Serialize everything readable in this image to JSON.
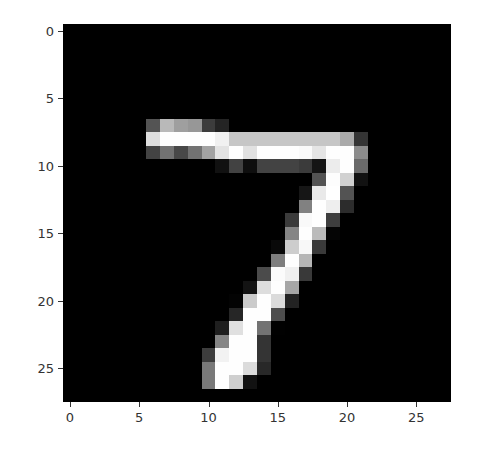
{
  "chart_data": {
    "type": "heatmap",
    "title": "",
    "xlabel": "",
    "ylabel": "",
    "colormap": "gray",
    "xlim": [
      -0.5,
      27.5
    ],
    "ylim": [
      27.5,
      -0.5
    ],
    "x_ticks": [
      0,
      5,
      10,
      15,
      20,
      25
    ],
    "y_ticks": [
      0,
      5,
      10,
      15,
      20,
      25
    ],
    "grid": false,
    "shape": [
      28,
      28
    ],
    "values": [
      [
        0,
        0,
        0,
        0,
        0,
        0,
        0,
        0,
        0,
        0,
        0,
        0,
        0,
        0,
        0,
        0,
        0,
        0,
        0,
        0,
        0,
        0,
        0,
        0,
        0,
        0,
        0,
        0
      ],
      [
        0,
        0,
        0,
        0,
        0,
        0,
        0,
        0,
        0,
        0,
        0,
        0,
        0,
        0,
        0,
        0,
        0,
        0,
        0,
        0,
        0,
        0,
        0,
        0,
        0,
        0,
        0,
        0
      ],
      [
        0,
        0,
        0,
        0,
        0,
        0,
        0,
        0,
        0,
        0,
        0,
        0,
        0,
        0,
        0,
        0,
        0,
        0,
        0,
        0,
        0,
        0,
        0,
        0,
        0,
        0,
        0,
        0
      ],
      [
        0,
        0,
        0,
        0,
        0,
        0,
        0,
        0,
        0,
        0,
        0,
        0,
        0,
        0,
        0,
        0,
        0,
        0,
        0,
        0,
        0,
        0,
        0,
        0,
        0,
        0,
        0,
        0
      ],
      [
        0,
        0,
        0,
        0,
        0,
        0,
        0,
        0,
        0,
        0,
        0,
        0,
        0,
        0,
        0,
        0,
        0,
        0,
        0,
        0,
        0,
        0,
        0,
        0,
        0,
        0,
        0,
        0
      ],
      [
        0,
        0,
        0,
        0,
        0,
        0,
        0,
        0,
        0,
        0,
        0,
        0,
        0,
        0,
        0,
        0,
        0,
        0,
        0,
        0,
        0,
        0,
        0,
        0,
        0,
        0,
        0,
        0
      ],
      [
        0,
        0,
        0,
        0,
        0,
        0,
        0,
        0,
        0,
        0,
        0,
        0,
        0,
        0,
        0,
        0,
        0,
        0,
        0,
        0,
        0,
        0,
        0,
        0,
        0,
        0,
        0,
        0
      ],
      [
        0,
        0,
        0,
        0,
        0,
        0,
        84,
        185,
        159,
        151,
        60,
        36,
        0,
        0,
        0,
        0,
        0,
        0,
        0,
        0,
        0,
        0,
        0,
        0,
        0,
        0,
        0,
        0
      ],
      [
        0,
        0,
        0,
        0,
        0,
        0,
        222,
        254,
        254,
        254,
        254,
        241,
        198,
        198,
        198,
        198,
        198,
        198,
        198,
        198,
        170,
        52,
        0,
        0,
        0,
        0,
        0,
        0
      ],
      [
        0,
        0,
        0,
        0,
        0,
        0,
        67,
        114,
        72,
        114,
        163,
        227,
        254,
        225,
        254,
        254,
        254,
        250,
        229,
        254,
        254,
        140,
        0,
        0,
        0,
        0,
        0,
        0
      ],
      [
        0,
        0,
        0,
        0,
        0,
        0,
        0,
        0,
        0,
        0,
        0,
        17,
        66,
        14,
        67,
        67,
        67,
        59,
        21,
        236,
        254,
        106,
        0,
        0,
        0,
        0,
        0,
        0
      ],
      [
        0,
        0,
        0,
        0,
        0,
        0,
        0,
        0,
        0,
        0,
        0,
        0,
        0,
        0,
        0,
        0,
        0,
        0,
        83,
        253,
        209,
        18,
        0,
        0,
        0,
        0,
        0,
        0
      ],
      [
        0,
        0,
        0,
        0,
        0,
        0,
        0,
        0,
        0,
        0,
        0,
        0,
        0,
        0,
        0,
        0,
        0,
        22,
        233,
        255,
        83,
        0,
        0,
        0,
        0,
        0,
        0,
        0
      ],
      [
        0,
        0,
        0,
        0,
        0,
        0,
        0,
        0,
        0,
        0,
        0,
        0,
        0,
        0,
        0,
        0,
        0,
        129,
        254,
        238,
        44,
        0,
        0,
        0,
        0,
        0,
        0,
        0
      ],
      [
        0,
        0,
        0,
        0,
        0,
        0,
        0,
        0,
        0,
        0,
        0,
        0,
        0,
        0,
        0,
        0,
        59,
        249,
        254,
        62,
        0,
        0,
        0,
        0,
        0,
        0,
        0,
        0
      ],
      [
        0,
        0,
        0,
        0,
        0,
        0,
        0,
        0,
        0,
        0,
        0,
        0,
        0,
        0,
        0,
        0,
        133,
        254,
        187,
        5,
        0,
        0,
        0,
        0,
        0,
        0,
        0,
        0
      ],
      [
        0,
        0,
        0,
        0,
        0,
        0,
        0,
        0,
        0,
        0,
        0,
        0,
        0,
        0,
        0,
        9,
        205,
        248,
        58,
        0,
        0,
        0,
        0,
        0,
        0,
        0,
        0,
        0
      ],
      [
        0,
        0,
        0,
        0,
        0,
        0,
        0,
        0,
        0,
        0,
        0,
        0,
        0,
        0,
        0,
        126,
        254,
        182,
        0,
        0,
        0,
        0,
        0,
        0,
        0,
        0,
        0,
        0
      ],
      [
        0,
        0,
        0,
        0,
        0,
        0,
        0,
        0,
        0,
        0,
        0,
        0,
        0,
        0,
        75,
        251,
        240,
        57,
        0,
        0,
        0,
        0,
        0,
        0,
        0,
        0,
        0,
        0
      ],
      [
        0,
        0,
        0,
        0,
        0,
        0,
        0,
        0,
        0,
        0,
        0,
        0,
        0,
        19,
        221,
        254,
        166,
        0,
        0,
        0,
        0,
        0,
        0,
        0,
        0,
        0,
        0,
        0
      ],
      [
        0,
        0,
        0,
        0,
        0,
        0,
        0,
        0,
        0,
        0,
        0,
        0,
        3,
        203,
        254,
        219,
        35,
        0,
        0,
        0,
        0,
        0,
        0,
        0,
        0,
        0,
        0,
        0
      ],
      [
        0,
        0,
        0,
        0,
        0,
        0,
        0,
        0,
        0,
        0,
        0,
        0,
        38,
        254,
        254,
        77,
        0,
        0,
        0,
        0,
        0,
        0,
        0,
        0,
        0,
        0,
        0,
        0
      ],
      [
        0,
        0,
        0,
        0,
        0,
        0,
        0,
        0,
        0,
        0,
        0,
        31,
        224,
        254,
        115,
        1,
        0,
        0,
        0,
        0,
        0,
        0,
        0,
        0,
        0,
        0,
        0,
        0
      ],
      [
        0,
        0,
        0,
        0,
        0,
        0,
        0,
        0,
        0,
        0,
        0,
        133,
        254,
        254,
        52,
        0,
        0,
        0,
        0,
        0,
        0,
        0,
        0,
        0,
        0,
        0,
        0,
        0
      ],
      [
        0,
        0,
        0,
        0,
        0,
        0,
        0,
        0,
        0,
        0,
        61,
        242,
        254,
        254,
        52,
        0,
        0,
        0,
        0,
        0,
        0,
        0,
        0,
        0,
        0,
        0,
        0,
        0
      ],
      [
        0,
        0,
        0,
        0,
        0,
        0,
        0,
        0,
        0,
        0,
        121,
        254,
        254,
        219,
        40,
        0,
        0,
        0,
        0,
        0,
        0,
        0,
        0,
        0,
        0,
        0,
        0,
        0
      ],
      [
        0,
        0,
        0,
        0,
        0,
        0,
        0,
        0,
        0,
        0,
        121,
        254,
        207,
        18,
        0,
        0,
        0,
        0,
        0,
        0,
        0,
        0,
        0,
        0,
        0,
        0,
        0,
        0
      ],
      [
        0,
        0,
        0,
        0,
        0,
        0,
        0,
        0,
        0,
        0,
        0,
        0,
        0,
        0,
        0,
        0,
        0,
        0,
        0,
        0,
        0,
        0,
        0,
        0,
        0,
        0,
        0,
        0
      ]
    ]
  },
  "axes": {
    "x_tick_labels": [
      "0",
      "5",
      "10",
      "15",
      "20",
      "25"
    ],
    "y_tick_labels": [
      "0",
      "5",
      "10",
      "15",
      "20",
      "25"
    ]
  }
}
